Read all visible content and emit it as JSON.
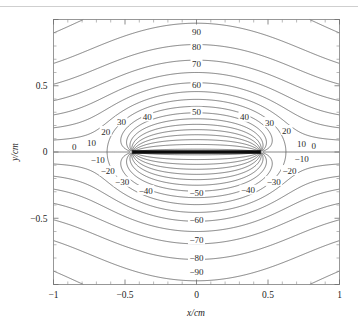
{
  "figure": {
    "title": "",
    "background_color": "#ffffff",
    "frame_color": "#8d8d8d",
    "contour_color": "#4a4a4a",
    "plate_color": "#0a0a0a"
  },
  "chart_data": {
    "type": "line",
    "subtype": "contour",
    "title": "",
    "xlabel": "x/cm",
    "ylabel": "y/cm",
    "xlim": [
      -1,
      1
    ],
    "ylim": [
      -1,
      1
    ],
    "grid": false,
    "legend": "none",
    "xticks": [
      -1,
      -0.5,
      0,
      0.5,
      1
    ],
    "xtick_labels": [
      "-1",
      "-0.5",
      "0",
      "0.5",
      "1"
    ],
    "yticks": [
      -0.5,
      0,
      0.5
    ],
    "ytick_labels": [
      "-0.5",
      "0",
      "0.5"
    ],
    "minor_tick_interval": 0.1,
    "tick_direction": "in",
    "contour_levels": [
      -90,
      -80,
      -70,
      -60,
      -50,
      -40,
      -30,
      -20,
      -10,
      0,
      10,
      20,
      30,
      40,
      50,
      60,
      70,
      80,
      90
    ],
    "contour_level_step": 10,
    "conductor_plate": {
      "y": 0,
      "x_start": -0.45,
      "x_end": 0.45,
      "description": "charged conducting strip drawn as a thick black horizontal bar along y = 0"
    },
    "labels": [
      {
        "text": "90",
        "x": 0.0,
        "y": 0.905,
        "value": 90
      },
      {
        "text": "80",
        "x": 0.0,
        "y": 0.795,
        "value": 80
      },
      {
        "text": "70",
        "x": 0.0,
        "y": 0.665,
        "value": 70
      },
      {
        "text": "60",
        "x": 0.0,
        "y": 0.505,
        "value": 60
      },
      {
        "text": "50",
        "x": 0.0,
        "y": 0.3,
        "value": 50
      },
      {
        "text": "40",
        "x": -0.345,
        "y": 0.265,
        "value": 40
      },
      {
        "text": "30",
        "x": -0.525,
        "y": 0.228,
        "value": 30
      },
      {
        "text": "20",
        "x": -0.635,
        "y": 0.155,
        "value": 20
      },
      {
        "text": "10",
        "x": -0.735,
        "y": 0.068,
        "value": 10
      },
      {
        "text": "0",
        "x": -0.855,
        "y": 0.042,
        "value": 0
      },
      {
        "text": "-10",
        "x": -0.69,
        "y": -0.06,
        "value": -10
      },
      {
        "text": "-20",
        "x": -0.62,
        "y": -0.145,
        "value": -20
      },
      {
        "text": "-30",
        "x": -0.52,
        "y": -0.228,
        "value": -30
      },
      {
        "text": "-40",
        "x": -0.355,
        "y": -0.29,
        "value": -40
      },
      {
        "text": "40",
        "x": 0.335,
        "y": 0.262,
        "value": 40
      },
      {
        "text": "30",
        "x": 0.51,
        "y": 0.222,
        "value": 30
      },
      {
        "text": "20",
        "x": 0.63,
        "y": 0.163,
        "value": 20
      },
      {
        "text": "10",
        "x": 0.735,
        "y": 0.062,
        "value": 10
      },
      {
        "text": "0",
        "x": 0.82,
        "y": 0.047,
        "value": 0
      },
      {
        "text": "-10",
        "x": 0.735,
        "y": -0.052,
        "value": -10
      },
      {
        "text": "-20",
        "x": 0.65,
        "y": -0.14,
        "value": -20
      },
      {
        "text": "-30",
        "x": 0.54,
        "y": -0.222,
        "value": -30
      },
      {
        "text": "-40",
        "x": 0.36,
        "y": -0.288,
        "value": -40
      },
      {
        "text": "-50",
        "x": 0.0,
        "y": -0.305,
        "value": -50
      },
      {
        "text": "-60",
        "x": 0.0,
        "y": -0.51,
        "value": -60
      },
      {
        "text": "-70",
        "x": 0.0,
        "y": -0.665,
        "value": -70
      },
      {
        "text": "-80",
        "x": 0.0,
        "y": -0.795,
        "value": -80
      },
      {
        "text": "-90",
        "x": 0.0,
        "y": -0.905,
        "value": -90
      }
    ]
  }
}
